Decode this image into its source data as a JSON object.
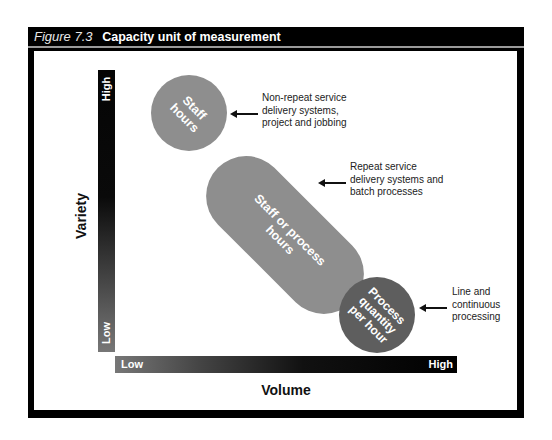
{
  "figure": {
    "number": "Figure 7.3",
    "title": "Capacity unit of measurement"
  },
  "axes": {
    "y": {
      "title": "Variety",
      "high": "High",
      "low": "Low"
    },
    "x": {
      "title": "Volume",
      "low": "Low",
      "high": "High"
    }
  },
  "shapes": [
    {
      "label": "Staff hours",
      "color": "#8e8e8e",
      "note": "Non-repeat service delivery systems, project and jobbing"
    },
    {
      "label": "Staff or process hours",
      "color": "#8e8e8e",
      "note": "Repeat service delivery systems and batch processes"
    },
    {
      "label": "Process quantity per hour",
      "color": "#5e5e5e",
      "note": "Line and continuous processing"
    }
  ],
  "notes": {
    "n1": [
      "Non-repeat service",
      "delivery systems,",
      "project and jobbing"
    ],
    "n2": [
      "Repeat service",
      "delivery systems and",
      "batch processes"
    ],
    "n3": [
      "Line and",
      "continuous",
      "processing"
    ]
  },
  "shape_lines": {
    "s1": [
      "Staff",
      "hours"
    ],
    "s2": [
      "Staff or process",
      "hours"
    ],
    "s3": [
      "Process",
      "quantity",
      "per hour"
    ]
  }
}
